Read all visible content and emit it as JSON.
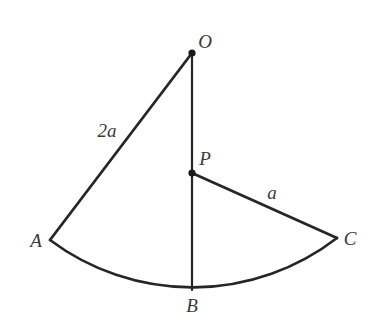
{
  "figure": {
    "type": "geometry-diagram",
    "background_color": "#ffffff",
    "stroke_color": "#262626",
    "label_color": "#3a3a3a",
    "stroke_width": 2.6,
    "points": [
      {
        "name": "O",
        "label": "O",
        "x": 192,
        "y": 53,
        "dot": true,
        "dot_radius": 3.6,
        "label_x": 205,
        "label_y": 41
      },
      {
        "name": "P",
        "label": "P",
        "x": 192,
        "y": 173,
        "dot": true,
        "dot_radius": 3.6,
        "label_x": 205,
        "label_y": 158
      },
      {
        "name": "A",
        "label": "A",
        "x": 50,
        "y": 240,
        "dot": false,
        "dot_radius": 0,
        "label_x": 36,
        "label_y": 240
      },
      {
        "name": "B",
        "label": "B",
        "x": 192,
        "y": 290,
        "dot": false,
        "dot_radius": 0,
        "label_x": 192,
        "label_y": 305
      },
      {
        "name": "C",
        "label": "C",
        "x": 337,
        "y": 238,
        "dot": false,
        "dot_radius": 0,
        "label_x": 350,
        "label_y": 238
      }
    ],
    "segments": [
      {
        "name": "OA",
        "from": "O",
        "to": "A",
        "path": "M 192 53 L 50 240"
      },
      {
        "name": "OB",
        "from": "O",
        "to": "B",
        "path": "M 192 53 L 192 290"
      },
      {
        "name": "PC",
        "from": "P",
        "to": "C",
        "path": "M 192 173 L 337 238"
      }
    ],
    "arcs": [
      {
        "name": "arc-ABC",
        "from": "A",
        "through": "B",
        "to": "C",
        "center": "O",
        "radius": 237,
        "path": "M 50 240 A 237 237 0 0 0 337 238"
      }
    ],
    "length_labels": [
      {
        "name": "2a",
        "text": "2a",
        "for_segment": "OA",
        "x": 107,
        "y": 130
      },
      {
        "name": "a",
        "text": "a",
        "for_segment": "PC",
        "x": 272,
        "y": 192
      }
    ]
  }
}
